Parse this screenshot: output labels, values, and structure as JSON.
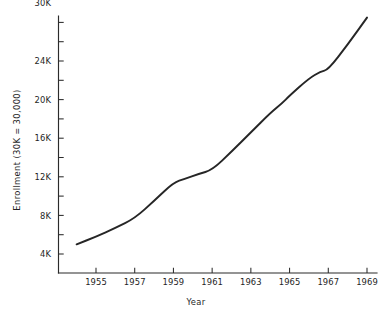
{
  "chart_data": {
    "type": "line",
    "title": "",
    "xlabel": "Year",
    "ylabel": "Enrollment (30K = 30,000)",
    "grid": false,
    "legend": false,
    "xlim": [
      1954,
      1969
    ],
    "ylim": [
      3000,
      31000
    ],
    "x_tick_labels": [
      "1955",
      "1957",
      "1959",
      "1961",
      "1963",
      "1965",
      "1967",
      "1969"
    ],
    "x_ticks": [
      1955,
      1957,
      1959,
      1961,
      1963,
      1965,
      1967,
      1969
    ],
    "y_tick_labels": [
      "4K",
      "8K",
      "12K",
      "16K",
      "20K",
      "24K",
      "30K"
    ],
    "y_ticks": [
      4000,
      8000,
      12000,
      16000,
      20000,
      24000,
      30000
    ],
    "y_minor_ticks": [
      6000,
      10000,
      14000,
      18000,
      22000,
      26000,
      28000
    ],
    "series": [
      {
        "name": "Enrollment",
        "color": "#262626",
        "x": [
          1954.0,
          1955.0,
          1956.0,
          1957.0,
          1958.0,
          1959.0,
          1959.6,
          1960.3,
          1961.0,
          1962.0,
          1963.0,
          1964.0,
          1964.6,
          1965.0,
          1966.0,
          1966.6,
          1967.0,
          1968.0,
          1969.0
        ],
        "values": [
          5000,
          5800,
          6700,
          7700,
          9500,
          11400,
          11800,
          12300,
          12700,
          14600,
          16600,
          18600,
          19600,
          20400,
          22200,
          22900,
          23100,
          25700,
          28500
        ]
      }
    ]
  }
}
